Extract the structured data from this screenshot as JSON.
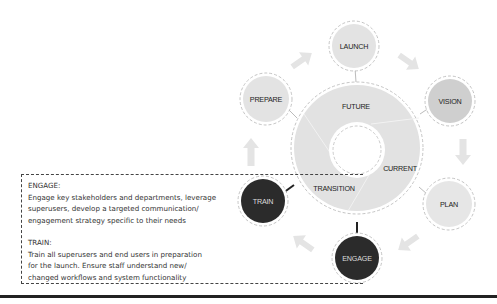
{
  "diagram": {
    "center": {
      "segments": [
        {
          "label": "FUTURE"
        },
        {
          "label": "CURRENT"
        },
        {
          "label": "TRANSITION"
        }
      ]
    },
    "nodes": [
      {
        "id": "launch",
        "label": "LAUNCH",
        "fill": "#e3e3e3",
        "text_color": "#222222"
      },
      {
        "id": "vision",
        "label": "VISION",
        "fill": "#cfcfcf",
        "text_color": "#222222"
      },
      {
        "id": "plan",
        "label": "PLAN",
        "fill": "#e6e6e6",
        "text_color": "#222222"
      },
      {
        "id": "engage",
        "label": "ENGAGE",
        "fill": "#2b2b2b",
        "text_color": "#dddddd"
      },
      {
        "id": "train",
        "label": "TRAIN",
        "fill": "#2b2b2b",
        "text_color": "#dddddd"
      },
      {
        "id": "prepare",
        "label": "PREPARE",
        "fill": "#e3e3e3",
        "text_color": "#222222"
      }
    ],
    "colors": {
      "ring_fill": "#e2e2e2",
      "arrow": "#e4e4e4",
      "dark_node": "#2b2b2b",
      "dashed_stroke": "#b5b5b5"
    }
  },
  "description": {
    "engage": {
      "heading": "ENGAGE:",
      "lines": [
        "Engage key stakeholders and departments, leverage",
        "superusers, develop a targeted communication/",
        "engagement strategy specific to their needs"
      ]
    },
    "train": {
      "heading": "TRAIN:",
      "lines": [
        "Train all superusers and end users in preparation",
        "for the launch. Ensure staff understand new/",
        "changed workflows and system functionality"
      ]
    }
  }
}
